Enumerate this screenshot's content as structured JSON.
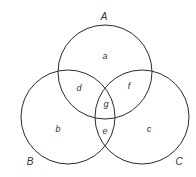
{
  "diagram": {
    "type": "venn-3-set",
    "stroke_color": "#2b2b2b",
    "sets": [
      {
        "id": "A",
        "label": "A",
        "cx": 105,
        "cy": 72,
        "r": 47,
        "label_x": 104,
        "label_y": 20
      },
      {
        "id": "B",
        "label": "B",
        "cx": 68,
        "cy": 117,
        "r": 47,
        "label_x": 30,
        "label_y": 165
      },
      {
        "id": "C",
        "label": "C",
        "cx": 142,
        "cy": 117,
        "r": 47,
        "label_x": 179,
        "label_y": 165
      }
    ],
    "regions": [
      {
        "id": "a",
        "label": "a",
        "x": 105,
        "y": 59,
        "desc": "A only"
      },
      {
        "id": "b",
        "label": "b",
        "x": 58,
        "y": 132,
        "desc": "B only"
      },
      {
        "id": "c",
        "label": "c",
        "x": 149,
        "y": 132,
        "desc": "C only"
      },
      {
        "id": "d",
        "label": "d",
        "x": 79,
        "y": 91,
        "desc": "A and B only"
      },
      {
        "id": "e",
        "label": "e",
        "x": 105,
        "y": 134,
        "desc": "B and C only"
      },
      {
        "id": "f",
        "label": "f",
        "x": 129,
        "y": 89,
        "desc": "A and C only"
      },
      {
        "id": "g",
        "label": "g",
        "x": 106,
        "y": 107,
        "desc": "A, B and C"
      }
    ]
  }
}
